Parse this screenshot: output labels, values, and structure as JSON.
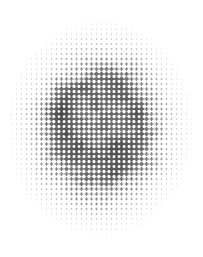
{
  "artwork": {
    "title": "Halftone Plus-Mark Dot Field",
    "kind": "abstract-raster-pattern",
    "background_color": "#ffffff",
    "ink_color": "#4a4a4a",
    "width": 203,
    "height": 257,
    "description": "Circular halftone field of plus/cross shaped marks on a square grid; marks grow larger and darker toward the centre and fade to faint specks at the rim."
  },
  "grid": {
    "pitch_x": 5.0,
    "pitch_y": 5.0,
    "origin_x": 1.5,
    "origin_y": 14.0,
    "columns": 41,
    "rows": 47,
    "mark_shape": "plus",
    "arm_ratio": 0.34
  },
  "envelope": {
    "shape": "ellipse",
    "center_x": 100,
    "center_y": 128,
    "radius_x": 101,
    "radius_y": 116,
    "falloff_start": 0.42,
    "falloff_end": 1.0
  },
  "tone": {
    "min_cell_fraction": 0.06,
    "max_cell_fraction": 1.28,
    "min_gray": 232,
    "max_gray": 74,
    "center_gray": 96,
    "rim_gray": 238,
    "noise_amount": 0.42,
    "cluster_scale": 0.26,
    "seed": 20240917
  },
  "chart_data": {
    "type": "heatmap",
    "title": "Halftone Plus-Mark Dot Field",
    "xlabel": "",
    "ylabel": "",
    "legend": [],
    "grid": false,
    "colormap": [
      "#ffffff",
      "#4a4a4a"
    ],
    "xlim": [
      0,
      203
    ],
    "ylim": [
      0,
      257
    ]
  }
}
